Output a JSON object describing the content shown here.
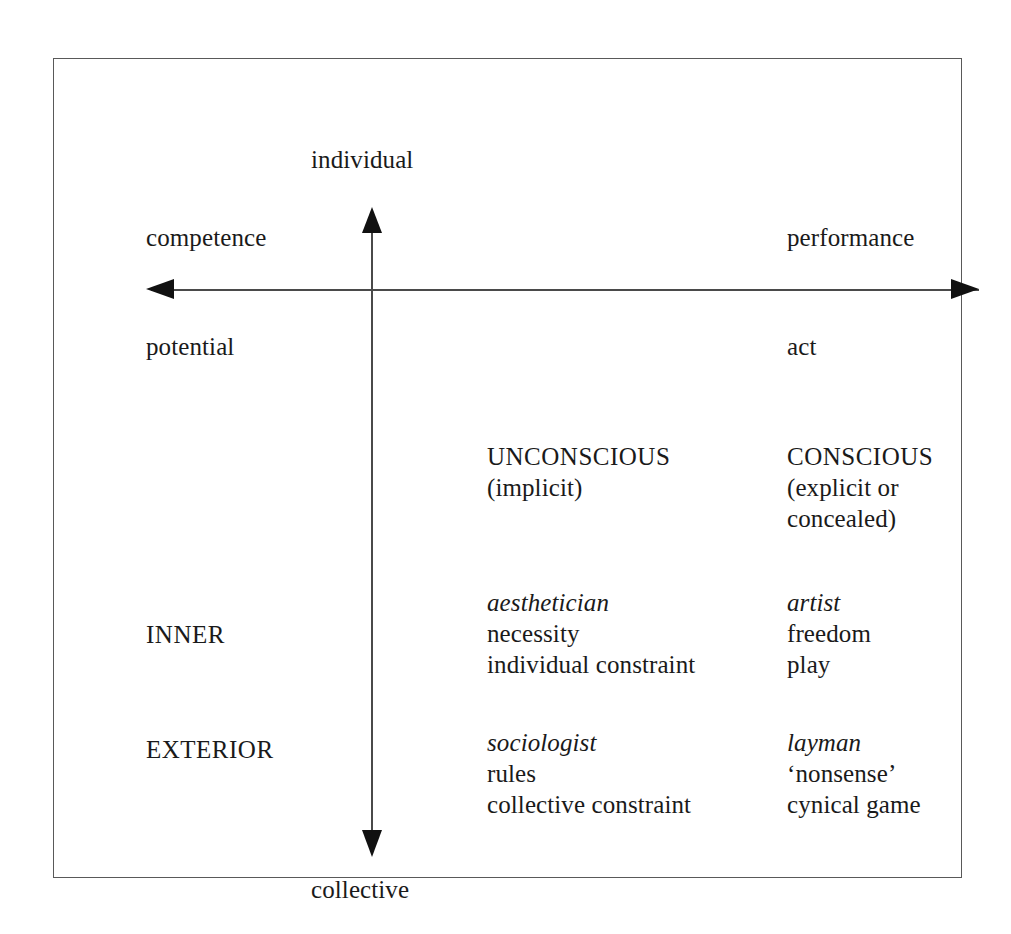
{
  "axes": {
    "top_label": "individual",
    "bottom_label": "collective",
    "left_label_upper": "competence",
    "left_label_lower": "potential",
    "right_label_upper": "performance",
    "right_label_lower": "act"
  },
  "row_labels": {
    "inner": "INNER",
    "exterior": "EXTERIOR"
  },
  "columns": {
    "col1": {
      "header": [
        "UNCONSCIOUS",
        "(implicit)"
      ],
      "inner": [
        "aesthetician",
        "necessity",
        "individual constraint"
      ],
      "exterior": [
        "sociologist",
        "rules",
        "collective constraint"
      ]
    },
    "col2": {
      "header": [
        "CONSCIOUS",
        "(explicit or",
        "concealed)"
      ],
      "inner": [
        "artist",
        "freedom",
        "play"
      ],
      "exterior": [
        "layman",
        "‘nonsense’",
        "cynical game"
      ]
    }
  },
  "style": {
    "frame_color": "#595959",
    "axis_color": "#4a4a4a",
    "arrow_color": "#111111",
    "text_color": "#1a1a1a",
    "background": "#ffffff"
  }
}
